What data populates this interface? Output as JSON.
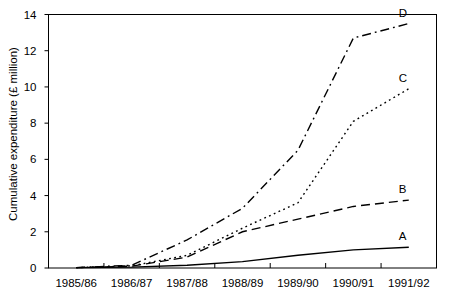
{
  "chart_data": {
    "type": "line",
    "title": "",
    "xlabel": "",
    "ylabel": "Cumulative expenditure (£ million)",
    "categories": [
      "1985/86",
      "1986/87",
      "1987/88",
      "1988/89",
      "1989/90",
      "1990/91",
      "1991/92"
    ],
    "ylim": [
      0,
      14
    ],
    "yticks": [
      0,
      2,
      4,
      6,
      8,
      10,
      12,
      14
    ],
    "ytick_labels": [
      "0",
      "2",
      "4",
      "6",
      "8",
      "10",
      "12",
      "14"
    ],
    "grid": false,
    "legend": "inline-end-labels",
    "series": [
      {
        "name": "A",
        "label": "A",
        "linestyle": "solid",
        "color": "#000000",
        "values": [
          0.02,
          0.05,
          0.15,
          0.35,
          0.7,
          1.0,
          1.15
        ]
      },
      {
        "name": "B",
        "label": "B",
        "linestyle": "dashed",
        "color": "#000000",
        "values": [
          0.02,
          0.1,
          0.6,
          2.0,
          2.7,
          3.4,
          3.75
        ]
      },
      {
        "name": "C",
        "label": "C",
        "linestyle": "dotted",
        "color": "#000000",
        "values": [
          0.02,
          0.12,
          0.7,
          2.2,
          3.6,
          8.1,
          9.9
        ]
      },
      {
        "name": "D",
        "label": "D",
        "linestyle": "dashdot",
        "color": "#000000",
        "values": [
          0.02,
          0.15,
          1.55,
          3.3,
          6.5,
          12.7,
          13.5
        ]
      }
    ]
  },
  "axes": {
    "frame_color": "#000000",
    "tick_color": "#000000"
  }
}
